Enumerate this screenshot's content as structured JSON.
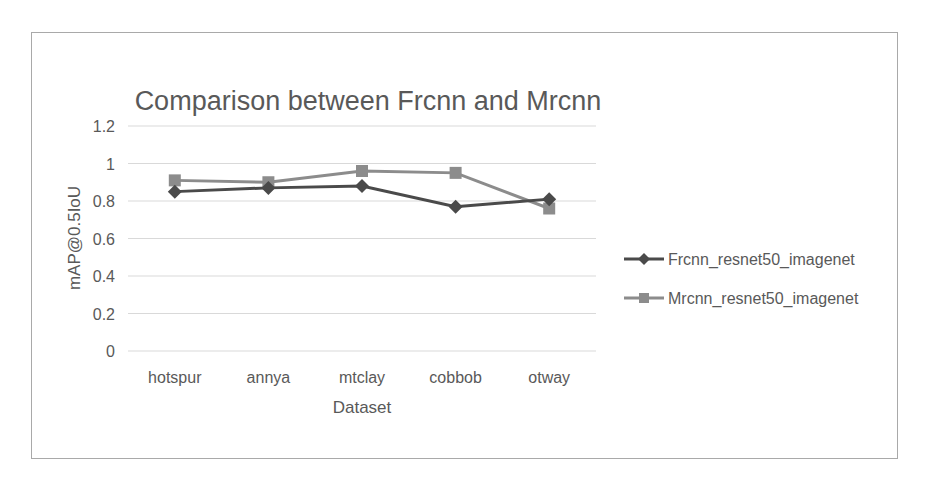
{
  "chart_data": {
    "type": "line",
    "title": "Comparison between Frcnn and Mrcnn",
    "xlabel": "Dataset",
    "ylabel": "mAP@0.5IoU",
    "categories": [
      "hotspur",
      "annya",
      "mtclay",
      "cobbob",
      "otway"
    ],
    "series": [
      {
        "name": "Frcnn_resnet50_imagenet",
        "marker": "diamond",
        "color": "#4a4a4a",
        "values": [
          0.85,
          0.87,
          0.88,
          0.77,
          0.81
        ]
      },
      {
        "name": "Mrcnn_resnet50_imagenet",
        "marker": "square",
        "color": "#8c8c8c",
        "values": [
          0.91,
          0.9,
          0.96,
          0.95,
          0.76
        ]
      }
    ],
    "ylim": [
      0,
      1.2
    ],
    "yticks": [
      "0",
      "0.2",
      "0.4",
      "0.6",
      "0.8",
      "1",
      "1.2"
    ],
    "grid": true,
    "legend_position": "right"
  }
}
